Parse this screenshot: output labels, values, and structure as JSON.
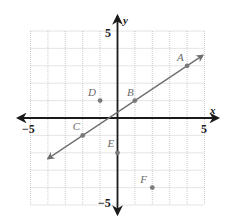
{
  "chart_data": {
    "type": "scatter",
    "title": "",
    "xlabel": "x",
    "ylabel": "y",
    "xlim": [
      -5,
      5
    ],
    "ylim": [
      -5,
      5
    ],
    "grid": true,
    "tick_labels": {
      "x_min": "−5",
      "x_max": "5",
      "y_max": "5",
      "y_min": "−5"
    },
    "points": [
      {
        "label": "A",
        "x": 4,
        "y": 3
      },
      {
        "label": "B",
        "x": 1,
        "y": 1
      },
      {
        "label": "C",
        "x": -2,
        "y": -1
      },
      {
        "label": "D",
        "x": -1,
        "y": 1
      },
      {
        "label": "E",
        "x": 0,
        "y": -2
      },
      {
        "label": "F",
        "x": 2,
        "y": -4
      }
    ],
    "line": {
      "through": [
        "C",
        "B",
        "A"
      ],
      "slope": 0.6667,
      "intercept": 0.3333,
      "x_from": -4,
      "x_to": 4.9
    },
    "colors": {
      "axis": "#1a1a1a",
      "grid": "#b5b5b5",
      "points": "#7a7a7a",
      "line": "#6e6e6e"
    }
  }
}
